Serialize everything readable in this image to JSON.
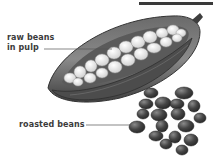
{
  "figure": {
    "top_rule": true,
    "labels": {
      "raw_line1": "raw beans",
      "raw_line2": "in pulp",
      "roasted": "roasted beans"
    },
    "subjects": [
      "cacao-pod",
      "raw-beans-in-pulp",
      "roasted-beans-pile"
    ],
    "colors": {
      "text": "#3b3b3b",
      "leader_line": "#555555",
      "pod_dark": "#4a4a4a",
      "pod_mid": "#7a7a7a",
      "pulp_light": "#e8e8e8",
      "roasted_bean": "#3a3a3a"
    }
  }
}
